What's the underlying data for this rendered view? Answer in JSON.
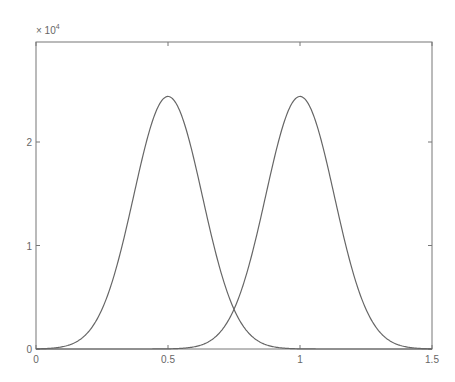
{
  "chart_data": {
    "type": "line",
    "title": "",
    "xlabel": "",
    "ylabel": "",
    "y_exponent_label": "× 10",
    "y_exponent_power": "4",
    "xlim": [
      0,
      1.5
    ],
    "ylim": [
      0,
      2.95
    ],
    "x_ticks": [
      "0",
      "0.5",
      "1",
      "1.5"
    ],
    "y_ticks": [
      "0",
      "1",
      "2"
    ],
    "grid": false,
    "legend": null,
    "series": [
      {
        "name": "gaussian-1",
        "mean": 0.5,
        "sigma": 0.13,
        "peak": 2.44,
        "color": "#666666"
      },
      {
        "name": "gaussian-2",
        "mean": 1.0,
        "sigma": 0.13,
        "peak": 2.44,
        "color": "#666666"
      }
    ],
    "sample_points": {
      "x": [
        0,
        0.2,
        0.3,
        0.4,
        0.5,
        0.6,
        0.7,
        0.75,
        0.8,
        0.9,
        1.0,
        1.1,
        1.2,
        1.3,
        1.5
      ],
      "series1": [
        0.0,
        0.17,
        0.75,
        1.81,
        2.44,
        1.81,
        0.75,
        0.38,
        0.17,
        0.02,
        0.0,
        0.0,
        0.0,
        0.0,
        0.0
      ],
      "series2": [
        0.0,
        0.0,
        0.0,
        0.0,
        0.0,
        0.02,
        0.17,
        0.38,
        0.75,
        1.81,
        2.44,
        1.81,
        0.75,
        0.17,
        0.0
      ]
    }
  }
}
